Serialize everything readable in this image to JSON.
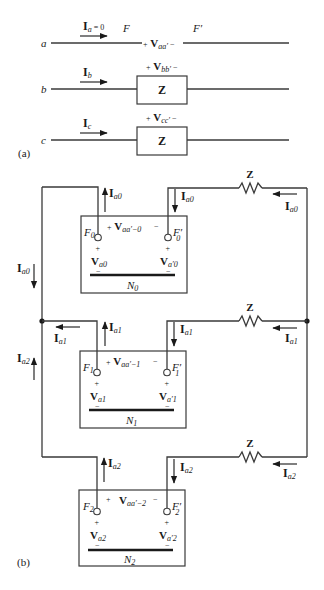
{
  "part_a": {
    "label": "(a)",
    "phases": [
      {
        "name": "a",
        "current_label": "I",
        "current_sub": "a",
        "current_extra": " = 0",
        "voltage_label": "V",
        "voltage_sub": "aa′",
        "left_point": "F",
        "right_point": "F′",
        "has_impedance": false
      },
      {
        "name": "b",
        "current_label": "I",
        "current_sub": "b",
        "voltage_label": "V",
        "voltage_sub": "bb′",
        "has_impedance": true,
        "impedance": "Z"
      },
      {
        "name": "c",
        "current_label": "I",
        "current_sub": "c",
        "voltage_label": "V",
        "voltage_sub": "cc′",
        "has_impedance": true,
        "impedance": "Z"
      }
    ]
  },
  "part_b": {
    "label": "(b)",
    "left_currents": [
      {
        "label": "I",
        "sub": "a0",
        "direction": "down"
      },
      {
        "label": "I",
        "sub": "a2",
        "direction": "up"
      }
    ],
    "networks": [
      {
        "name": "N",
        "sub": "0",
        "seq": "0",
        "left_terminal": "F",
        "right_terminal": "F′",
        "v_between": "V",
        "v_between_sub": "aa′−0",
        "v_left": "V",
        "v_left_sub": "a0",
        "v_right": "V",
        "v_right_sub": "a′0",
        "current": "I",
        "current_sub": "a0",
        "impedance": "Z"
      },
      {
        "name": "N",
        "sub": "1",
        "seq": "1",
        "left_terminal": "F",
        "right_terminal": "F′",
        "v_between": "V",
        "v_between_sub": "aa′−1",
        "v_left": "V",
        "v_left_sub": "a1",
        "v_right": "V",
        "v_right_sub": "a′1",
        "current": "I",
        "current_sub": "a1",
        "impedance": "Z"
      },
      {
        "name": "N",
        "sub": "2",
        "seq": "2",
        "left_terminal": "F",
        "right_terminal": "F′",
        "v_between": "V",
        "v_between_sub": "aa′−2",
        "v_left": "V",
        "v_left_sub": "a2",
        "v_right": "V",
        "v_right_sub": "a′2",
        "current": "I",
        "current_sub": "a2",
        "impedance": "Z"
      }
    ],
    "plus_sign": "+",
    "minus_sign": "−"
  }
}
